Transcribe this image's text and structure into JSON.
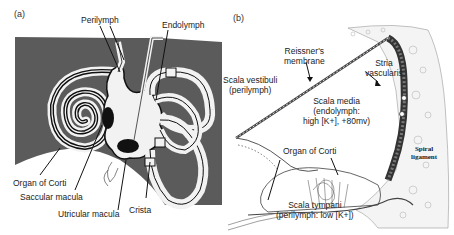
{
  "figure": {
    "panels": [
      {
        "id": "a",
        "letter": "(a)",
        "title": "Inner ear labyrinth schematic",
        "background_color": "#5a5a5a",
        "labels": {
          "perilymph": "Perilymph",
          "endolymph": "Endolymph",
          "organ_of_corti": "Organ of Corti",
          "saccular_macula": "Saccular macula",
          "utricular_macula": "Utricular macula",
          "crista": "Crista"
        }
      },
      {
        "id": "b",
        "letter": "(b)",
        "title": "Cochlear duct cross-section",
        "labels": {
          "reissners_line1": "Reissner's",
          "reissners_line2": "membrane",
          "stria_line1": "Stria",
          "stria_line2": "vascularis",
          "scala_vestibuli_line1": "Scala vestibuli",
          "scala_vestibuli_line2": "(perilymph)",
          "scala_media_line1": "Scala media",
          "scala_media_line2": "(endolymph:",
          "scala_media_line3": "high [K+], +80mv)",
          "organ_of_corti": "Organ of Corti",
          "spiral_line1": "Spiral",
          "spiral_line2": "ligament",
          "scala_tympani_line1": "Scala tympani",
          "scala_tympani_line2": "(perilymph: low [K+])"
        }
      }
    ]
  }
}
